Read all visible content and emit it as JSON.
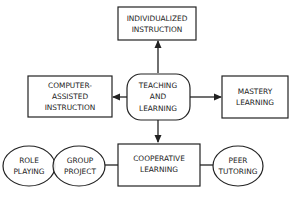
{
  "diagram": {
    "nodes": {
      "individualized": {
        "lines": [
          "INDIVIDUALIZED",
          "INSTRUCTION"
        ],
        "shape": "rectangle"
      },
      "teaching": {
        "lines": [
          "TEACHING",
          "AND",
          "LEARNING"
        ],
        "shape": "rounded-rectangle"
      },
      "computer": {
        "lines": [
          "COMPUTER-",
          "ASSISTED",
          "INSTRUCTION"
        ],
        "shape": "rectangle"
      },
      "mastery": {
        "lines": [
          "MASTERY",
          "LEARNING"
        ],
        "shape": "rectangle"
      },
      "cooperative": {
        "lines": [
          "COOPERATIVE",
          "LEARNING"
        ],
        "shape": "rectangle"
      },
      "role": {
        "lines": [
          "ROLE",
          "PLAYING"
        ],
        "shape": "ellipse"
      },
      "group": {
        "lines": [
          "GROUP",
          "PROJECT"
        ],
        "shape": "ellipse"
      },
      "peer": {
        "lines": [
          "PEER",
          "TUTORING"
        ],
        "shape": "ellipse"
      }
    },
    "edges": [
      {
        "from": "teaching",
        "to": "individualized",
        "type": "arrow"
      },
      {
        "from": "teaching",
        "to": "computer",
        "type": "arrow"
      },
      {
        "from": "teaching",
        "to": "mastery",
        "type": "arrow"
      },
      {
        "from": "teaching",
        "to": "cooperative",
        "type": "arrow"
      },
      {
        "from": "cooperative",
        "to": "group",
        "type": "line"
      },
      {
        "from": "cooperative",
        "to": "peer",
        "type": "line"
      }
    ],
    "colors": {
      "stroke": "#222222",
      "background": "#ffffff",
      "text": "#222222"
    }
  }
}
